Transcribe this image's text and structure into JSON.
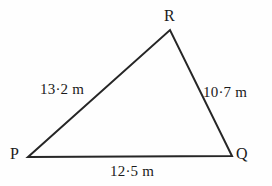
{
  "diagram": {
    "type": "triangle",
    "background_color": "#fefefe",
    "stroke_color": "#262626",
    "text_color": "#1a1a1a",
    "stroke_width": 2,
    "vertices": [
      {
        "id": "P",
        "label": "P",
        "x": 28,
        "y": 157
      },
      {
        "id": "Q",
        "label": "Q",
        "x": 232,
        "y": 156
      },
      {
        "id": "R",
        "label": "R",
        "x": 170,
        "y": 30
      }
    ],
    "sides": [
      {
        "id": "PR",
        "from": "P",
        "to": "R",
        "label": "13·2 m",
        "value": 13.2,
        "unit": "m"
      },
      {
        "id": "RQ",
        "from": "R",
        "to": "Q",
        "label": "10·7 m",
        "value": 10.7,
        "unit": "m"
      },
      {
        "id": "PQ",
        "from": "P",
        "to": "Q",
        "label": "12·5 m",
        "value": 12.5,
        "unit": "m"
      }
    ]
  }
}
